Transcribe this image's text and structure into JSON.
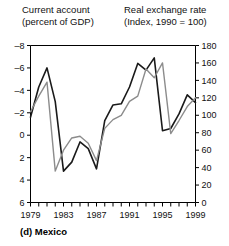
{
  "header": {
    "left_title_line1": "Current account",
    "left_title_line2": "(percent of GDP)",
    "right_title_line1": "Real exchange rate",
    "right_title_line2": "(Index, 1990 = 100)"
  },
  "caption": "(d)  Mexico",
  "chart_data": {
    "type": "line",
    "title": "",
    "xlabel": "",
    "ylabel": "Current account (percent of GDP)",
    "y2label": "Real exchange rate (Index, 1990 = 100)",
    "grid": false,
    "legend_position": "above-axes",
    "x": [
      1979,
      1980,
      1981,
      1982,
      1983,
      1984,
      1985,
      1986,
      1987,
      1988,
      1989,
      1990,
      1991,
      1992,
      1993,
      1994,
      1995,
      1996,
      1997,
      1998,
      1999
    ],
    "xlim": [
      1979,
      1999
    ],
    "xticks": [
      1979,
      1980,
      1981,
      1982,
      1983,
      1984,
      1985,
      1986,
      1987,
      1988,
      1989,
      1990,
      1991,
      1992,
      1993,
      1994,
      1995,
      1996,
      1997,
      1998,
      1999
    ],
    "xtick_labels": [
      "1979",
      "",
      "",
      "",
      "1983",
      "",
      "",
      "",
      "1987",
      "",
      "",
      "",
      "1991",
      "",
      "",
      "",
      "1995",
      "",
      "",
      "",
      "1999"
    ],
    "ylim": [
      6,
      -8
    ],
    "yticks": [
      -8,
      -6,
      -4,
      -2,
      0,
      2,
      4,
      6
    ],
    "ytick_labels": [
      "–8",
      "–6",
      "–4",
      "–2",
      "0",
      "2",
      "4",
      "6"
    ],
    "y2lim": [
      0,
      180
    ],
    "y2ticks": [
      0,
      20,
      40,
      60,
      80,
      100,
      120,
      140,
      160,
      180
    ],
    "y2tick_labels": [
      "0",
      "20",
      "40",
      "60",
      "80",
      "100",
      "120",
      "140",
      "160",
      "180"
    ],
    "series": [
      {
        "name": "Current account (percent of GDP)",
        "axis": "left",
        "color": "#1a1a1a",
        "width": 1.6,
        "values": [
          -1.6,
          -4.3,
          -6.0,
          -3.0,
          3.2,
          2.4,
          0.6,
          1.2,
          3.0,
          -1.3,
          -2.7,
          -2.8,
          -4.3,
          -6.4,
          -5.8,
          -6.9,
          -0.4,
          -0.6,
          -1.9,
          -3.6,
          -2.9
        ]
      },
      {
        "name": "Real exchange rate (Index, 1990 = 100)",
        "axis": "right",
        "color": "#8c8c8c",
        "width": 1.4,
        "values": [
          104,
          122,
          138,
          36,
          60,
          74,
          76,
          68,
          48,
          85,
          95,
          100,
          116,
          122,
          153,
          143,
          160,
          79,
          94,
          110,
          120
        ]
      }
    ]
  }
}
